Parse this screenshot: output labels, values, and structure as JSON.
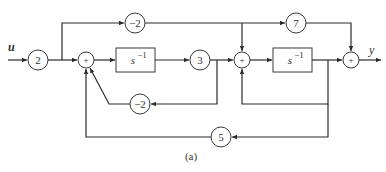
{
  "diagram": {
    "input_label": "u",
    "output_label": "y",
    "caption": "(a)",
    "gains": {
      "input_gain": "2",
      "feedforward_top": "−2",
      "after_integrator1": "3",
      "feedback_inner1": "−2",
      "feedforward_to_output": "7",
      "feedback_outer": "5"
    },
    "integrators": {
      "integrator1": {
        "base": "s",
        "exp": "−1"
      },
      "integrator2": {
        "base": "s",
        "exp": "−1"
      }
    },
    "summers": {
      "sum1": "+",
      "sum2": "+",
      "sum3": "+"
    },
    "colors": {
      "line": "#2a2a2a",
      "text": "#333333",
      "background": "#ffffff"
    }
  }
}
